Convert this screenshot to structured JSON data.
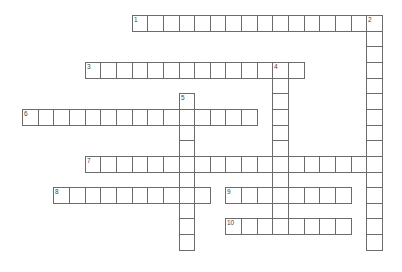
{
  "puzzle": {
    "type": "crossword",
    "grid": {
      "origin_x": 22,
      "origin_y": 15,
      "cell_size": 15.65
    },
    "colors": {
      "line": "#6b6b6b",
      "background": "#ffffff",
      "number": "#444444"
    },
    "entries": [
      {
        "number": "1",
        "direction": "across",
        "row": 0,
        "col": 7,
        "length": 16
      },
      {
        "number": "2",
        "direction": "down",
        "row": 0,
        "col": 22,
        "length": 15
      },
      {
        "number": "3",
        "direction": "across",
        "row": 3,
        "col": 4,
        "length": 14
      },
      {
        "number": "4",
        "direction": "down",
        "row": 3,
        "col": 16,
        "length": 11
      },
      {
        "number": "5",
        "direction": "down",
        "row": 5,
        "col": 10,
        "length": 10
      },
      {
        "number": "6",
        "direction": "across",
        "row": 6,
        "col": 0,
        "length": 15
      },
      {
        "number": "7",
        "direction": "across",
        "row": 9,
        "col": 4,
        "length": 19
      },
      {
        "number": "8",
        "direction": "across",
        "row": 11,
        "col": 2,
        "length": 10
      },
      {
        "number": "9",
        "direction": "across",
        "row": 11,
        "col": 13,
        "length": 8
      },
      {
        "number": "10",
        "direction": "across",
        "row": 13,
        "col": 13,
        "length": 8
      }
    ]
  }
}
